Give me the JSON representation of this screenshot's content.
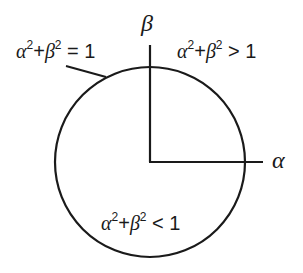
{
  "diagram": {
    "colors": {
      "stroke": "#1a1a1a",
      "background": "#ffffff"
    },
    "axes": {
      "x_label": "α",
      "y_label": "β"
    },
    "regions": {
      "on_circle": {
        "var1": "α",
        "exp1": "2",
        "plus": "+",
        "var2": "β",
        "exp2": "2",
        "relation": " = 1"
      },
      "outside": {
        "var1": "α",
        "exp1": "2",
        "plus": "+",
        "var2": "β",
        "exp2": "2",
        "relation": " > 1"
      },
      "inside": {
        "var1": "α",
        "exp1": "2",
        "plus": "+",
        "var2": "β",
        "exp2": "2",
        "relation": " < 1"
      }
    }
  }
}
